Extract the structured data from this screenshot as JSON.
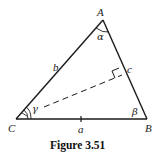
{
  "figure": {
    "caption": "Figure 3.51",
    "vertices": {
      "A": {
        "label": "A",
        "x": 103,
        "y": 20
      },
      "B": {
        "label": "B",
        "x": 147,
        "y": 119
      },
      "C": {
        "label": "C",
        "x": 16,
        "y": 119
      }
    },
    "sides": {
      "a": {
        "label": "a"
      },
      "b": {
        "label": "b"
      },
      "c": {
        "label": "c"
      }
    },
    "angles": {
      "alpha": {
        "label": "α"
      },
      "beta": {
        "label": "β"
      },
      "gamma": {
        "label": "γ"
      }
    },
    "colors": {
      "stroke": "#1a1a1a",
      "background": "#ffffff"
    }
  }
}
